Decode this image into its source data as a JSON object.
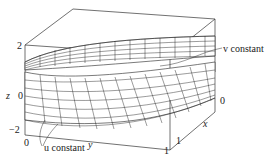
{
  "figure": {
    "axes": {
      "z": {
        "label": "z",
        "ticks": [
          "2",
          "0",
          "−2"
        ]
      },
      "y": {
        "label": "y",
        "ticks": [
          "0",
          "1"
        ]
      },
      "x": {
        "label": "x",
        "ticks": [
          "0",
          "1"
        ]
      }
    },
    "annotations": {
      "v_constant": "v constant",
      "u_constant": "u constant"
    },
    "colors": {
      "line": "#222222",
      "background": "#ffffff",
      "surface_fill": "#ffffff"
    }
  },
  "labels": {
    "z_axis": "z",
    "z_tick_top": "2",
    "z_tick_mid": "0",
    "z_tick_bottom": "−2",
    "y_axis": "y",
    "y_tick_0": "0",
    "y_tick_1": "1",
    "x_axis": "x",
    "x_tick_0": "0",
    "x_tick_1": "1",
    "v_constant": "v constant",
    "u_constant": "u constant"
  }
}
